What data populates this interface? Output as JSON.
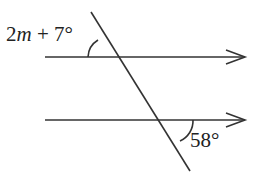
{
  "diagram": {
    "type": "parallel lines cut by a transversal",
    "angles": {
      "top": {
        "var": "m",
        "prefix": "2",
        "suffix": " + 7°",
        "full": "2m + 7°"
      },
      "bottom": {
        "label": "58°"
      }
    },
    "stroke_color": "#333333"
  }
}
